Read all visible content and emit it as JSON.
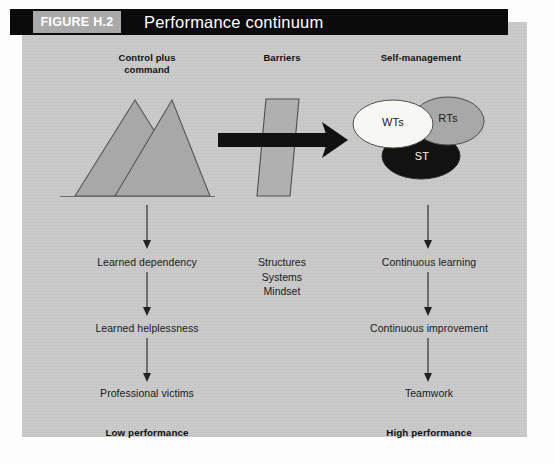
{
  "figure": {
    "tag": "FIGURE H.2",
    "title": "Performance continuum"
  },
  "columns": {
    "left_heading": "Control plus\ncommand",
    "middle_heading": "Barriers",
    "right_heading": "Self-management"
  },
  "left_flow": {
    "step1": "Learned dependency",
    "step2": "Learned helplessness",
    "step3": "Professional victims",
    "outcome": "Low performance"
  },
  "middle_flow": {
    "item1": "Structures",
    "item2": "Systems",
    "item3": "Mindset"
  },
  "right_flow": {
    "step1": "Continuous learning",
    "step2": "Continuous improvement",
    "step3": "Teamwork",
    "outcome": "High performance"
  },
  "venn": {
    "left_circle": "WTs",
    "right_circle": "RTs",
    "bottom_circle": "ST"
  },
  "colors": {
    "panel_background": "#c9c9c9",
    "header_bar": "#0b0b0b",
    "figure_tag_background": "#a9a9a9",
    "shape_gray": "#a8a8a8",
    "shape_outline": "#4a4a4a",
    "venn_white": "#f7f7f4",
    "venn_gray": "#a8a8a8",
    "venn_black": "#121212",
    "arrow_black": "#111111",
    "text_dark": "#1a1a1a"
  }
}
